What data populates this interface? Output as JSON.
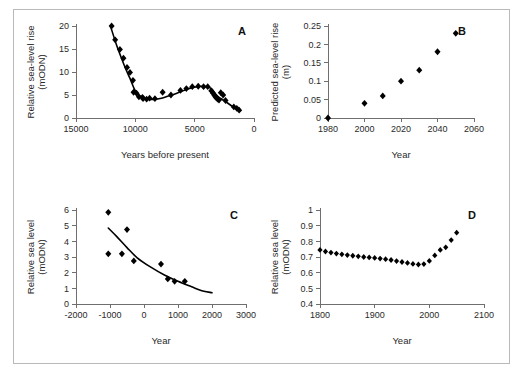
{
  "figure": {
    "panels": [
      "A",
      "B",
      "C",
      "D"
    ],
    "border_color": "#b9b9b9",
    "marker_color": "#000000",
    "axis_color": "#6f6f6f"
  },
  "chart_data": [
    {
      "id": "A",
      "type": "scatter",
      "title": "",
      "label": "A",
      "xlabel": "Years before present",
      "ylabel": "Relative sea-level rise (mODN)",
      "ylabel_line1": "Relative sea-level rise",
      "ylabel_line2": "(mODN)",
      "xlim": [
        15000,
        0
      ],
      "ylim": [
        0,
        20
      ],
      "x_reversed": true,
      "xticks": [
        15000,
        10000,
        5000,
        0
      ],
      "xticklabels": [
        "15000",
        "10000",
        "5000",
        "0"
      ],
      "yticks": [
        0,
        5,
        10,
        15,
        20
      ],
      "yticklabels": [
        "0",
        "5",
        "10",
        "15",
        "20"
      ],
      "grid": false,
      "legend": "none",
      "x": [
        12000,
        11700,
        11300,
        11000,
        10700,
        10450,
        10200,
        10150,
        9900,
        9700,
        9400,
        9350,
        9050,
        8800,
        8350,
        7700,
        7000,
        6200,
        5700,
        5200,
        4700,
        4250,
        3900,
        3600,
        3450,
        3350,
        3250,
        3150,
        3050,
        2950,
        2800,
        2600,
        2400,
        1700,
        1450,
        1250
      ],
      "y": [
        20.0,
        17.0,
        14.9,
        13.0,
        11.0,
        9.9,
        8.2,
        5.6,
        5.4,
        4.6,
        4.5,
        4.2,
        4.1,
        4.3,
        4.2,
        5.6,
        5.0,
        6.0,
        6.4,
        6.8,
        6.9,
        6.8,
        6.8,
        5.9,
        5.4,
        5.0,
        4.6,
        4.3,
        4.1,
        3.9,
        5.5,
        5.0,
        3.8,
        2.4,
        2.1,
        1.7
      ],
      "has_fit_curve": true
    },
    {
      "id": "B",
      "type": "scatter",
      "title": "",
      "label": "B",
      "xlabel": "Year",
      "ylabel": "Predicted sea-level rise (m)",
      "ylabel_line1": "Predicted sea-level rise",
      "ylabel_line2": "(m)",
      "xlim": [
        1980,
        2060
      ],
      "ylim": [
        0,
        0.25
      ],
      "x_reversed": false,
      "xticks": [
        1980,
        2000,
        2020,
        2040,
        2060
      ],
      "xticklabels": [
        "1980",
        "2000",
        "2020",
        "2040",
        "2060"
      ],
      "yticks": [
        0,
        0.05,
        0.1,
        0.15,
        0.2,
        0.25
      ],
      "yticklabels": [
        "0",
        "0.05",
        "0.1",
        "0.15",
        "0.2",
        "0.25"
      ],
      "grid": false,
      "legend": "none",
      "x": [
        1980,
        2000,
        2010,
        2020,
        2030,
        2040,
        2050
      ],
      "y": [
        0.0,
        0.04,
        0.06,
        0.1,
        0.13,
        0.18,
        0.23
      ],
      "has_fit_curve": false
    },
    {
      "id": "C",
      "type": "scatter",
      "title": "",
      "label": "C",
      "xlabel": "Year",
      "ylabel": "Relative sea level (mODN)",
      "ylabel_line1": "Relative sea level",
      "ylabel_line2": "(mODN)",
      "xlim": [
        -2000,
        3000
      ],
      "ylim": [
        0,
        6
      ],
      "x_reversed": false,
      "xticks": [
        -2000,
        -1000,
        0,
        1000,
        2000,
        3000
      ],
      "xticklabels": [
        "-2000",
        "-1000",
        "0",
        "1000",
        "2000",
        "3000"
      ],
      "yticks": [
        0,
        1,
        2,
        3,
        4,
        5,
        6
      ],
      "yticklabels": [
        "0",
        "1",
        "2",
        "3",
        "4",
        "5",
        "6"
      ],
      "grid": false,
      "legend": "none",
      "x": [
        -1050,
        -1050,
        -650,
        -500,
        -300,
        500,
        700,
        900,
        1200
      ],
      "y": [
        5.85,
        3.2,
        3.2,
        4.75,
        2.75,
        2.55,
        1.6,
        1.45,
        1.45
      ],
      "has_fit_curve": true
    },
    {
      "id": "D",
      "type": "scatter",
      "title": "",
      "label": "D",
      "xlabel": "Year",
      "ylabel": "Relative sea level (mODN)",
      "ylabel_line1": "Relative sea level",
      "ylabel_line2": "(mODN)",
      "xlim": [
        1800,
        2100
      ],
      "ylim": [
        0.4,
        1.0
      ],
      "x_reversed": false,
      "xticks": [
        1800,
        1900,
        2000,
        2100
      ],
      "xticklabels": [
        "1800",
        "1900",
        "2000",
        "2100"
      ],
      "yticks": [
        0.4,
        0.5,
        0.6,
        0.7,
        0.8,
        0.9,
        1.0
      ],
      "yticklabels": [
        "0.4",
        "0.5",
        "0.6",
        "0.7",
        "0.8",
        "0.9",
        "1"
      ],
      "grid": false,
      "legend": "none",
      "x": [
        1800,
        1810,
        1820,
        1830,
        1840,
        1850,
        1860,
        1870,
        1880,
        1890,
        1900,
        1910,
        1920,
        1930,
        1940,
        1950,
        1960,
        1970,
        1980,
        1990,
        2000,
        2010,
        2020,
        2030,
        2040,
        2050
      ],
      "y": [
        0.745,
        0.735,
        0.728,
        0.722,
        0.717,
        0.712,
        0.708,
        0.704,
        0.7,
        0.697,
        0.694,
        0.69,
        0.686,
        0.681,
        0.674,
        0.668,
        0.662,
        0.656,
        0.652,
        0.655,
        0.675,
        0.71,
        0.745,
        0.762,
        0.808,
        0.855
      ],
      "has_fit_curve": false
    }
  ]
}
